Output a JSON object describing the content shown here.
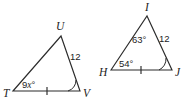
{
  "figure": {
    "background_color": "#ffffff",
    "stroke_color": "#2b2b2b",
    "text_color": "#1d1d1d"
  },
  "triangles": [
    {
      "id": "left",
      "name": "triangle-TUV",
      "vertices": [
        {
          "label": "T",
          "x": 13,
          "y": 91
        },
        {
          "label": "U",
          "x": 61,
          "y": 36
        },
        {
          "label": "V",
          "x": 80,
          "y": 91
        }
      ],
      "vertex_labels": [
        {
          "name": "vertex-label-T",
          "text": "T",
          "x": 4,
          "y": 96
        },
        {
          "name": "vertex-label-U",
          "text": "U",
          "x": 57,
          "y": 30
        },
        {
          "name": "vertex-label-V",
          "text": "V",
          "x": 83,
          "y": 96
        }
      ],
      "side_labels": [
        {
          "name": "side-label-UV",
          "text": "12",
          "x": 72,
          "y": 59
        }
      ],
      "angle_labels": [
        {
          "name": "angle-label-T",
          "prefix": "9",
          "variable": "x",
          "suffix": "°",
          "x": 24,
          "y": 87
        }
      ],
      "tick_marks": [
        {
          "name": "tick-mark-TV",
          "count": 1,
          "side": "TV",
          "x": 47,
          "y": 91
        }
      ],
      "angle_arcs": [
        {
          "name": "angle-arc-V",
          "vertex": "V",
          "count": 1
        }
      ]
    },
    {
      "id": "right",
      "name": "triangle-HIJ",
      "vertices": [
        {
          "label": "H",
          "x": 111,
          "y": 70
        },
        {
          "label": "I",
          "x": 147,
          "y": 16
        },
        {
          "label": "J",
          "x": 172,
          "y": 70
        }
      ],
      "vertex_labels": [
        {
          "name": "vertex-label-H",
          "text": "H",
          "x": 100,
          "y": 75
        },
        {
          "name": "vertex-label-I",
          "text": "I",
          "x": 144,
          "y": 10
        },
        {
          "name": "vertex-label-J",
          "text": "J",
          "x": 175,
          "y": 75
        }
      ],
      "side_labels": [
        {
          "name": "side-label-IJ",
          "text": "12",
          "x": 160,
          "y": 41
        }
      ],
      "angle_labels": [
        {
          "name": "angle-label-I",
          "text": "63°",
          "x": 133,
          "y": 42
        },
        {
          "name": "angle-label-H",
          "text": "54°",
          "x": 120,
          "y": 66
        }
      ],
      "tick_marks": [
        {
          "name": "tick-mark-HJ",
          "count": 1,
          "side": "HJ",
          "x": 141,
          "y": 70
        }
      ],
      "angle_arcs": [
        {
          "name": "angle-arc-J",
          "vertex": "J",
          "count": 1
        }
      ]
    }
  ]
}
